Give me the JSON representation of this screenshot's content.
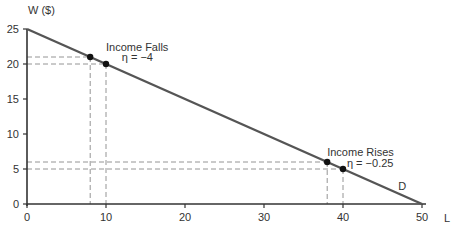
{
  "chart_data": {
    "type": "line",
    "title": "",
    "xlabel": "L",
    "ylabel": "W ($)",
    "xlim": [
      0,
      50
    ],
    "ylim": [
      0,
      25
    ],
    "x_ticks": [
      0,
      10,
      20,
      30,
      40,
      50
    ],
    "y_ticks": [
      0,
      5,
      10,
      15,
      20,
      25
    ],
    "grid": false,
    "series": [
      {
        "name": "D",
        "x": [
          0,
          50
        ],
        "y": [
          25,
          0
        ]
      }
    ],
    "points": [
      {
        "x": 8,
        "y": 21
      },
      {
        "x": 10,
        "y": 20
      },
      {
        "x": 38,
        "y": 6
      },
      {
        "x": 40,
        "y": 5
      }
    ],
    "annotations": [
      {
        "text": "Income Falls",
        "x": 10,
        "y": 21.8
      },
      {
        "text": "η = −4",
        "x": 12,
        "y": 20.4
      },
      {
        "text": "Income Rises",
        "x": 38,
        "y": 6.8
      },
      {
        "text": "η = −0.25",
        "x": 40.5,
        "y": 5.3
      },
      {
        "text": "D",
        "x": 47,
        "y": 2
      }
    ],
    "curve_label": "D"
  },
  "colors": {
    "line": "#555555",
    "axis": "#333333",
    "dash": "#888888",
    "text": "#333333"
  }
}
